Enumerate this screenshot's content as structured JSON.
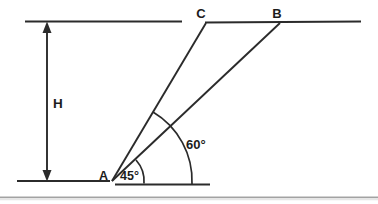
{
  "diagram": {
    "labels": {
      "height": "H",
      "point_a": "A",
      "point_c": "C",
      "point_b": "B",
      "angle_small": "45°",
      "angle_large": "60°"
    },
    "colors": {
      "line": "#2b2b2b",
      "text": "#1c1c1c",
      "background": "#ffffff",
      "divider_dark": "#8f8f8f",
      "divider_light": "#e6e6e6"
    }
  }
}
